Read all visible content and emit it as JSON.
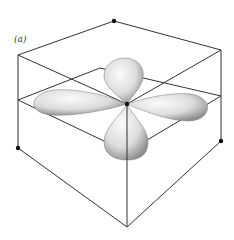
{
  "figure": {
    "panel_label": "(a)",
    "colors": {
      "line": "#333333",
      "lobe_light": "#f2f2f2",
      "lobe_dark": "#9a9a9a",
      "dot": "#111111",
      "background": "#ffffff"
    }
  }
}
